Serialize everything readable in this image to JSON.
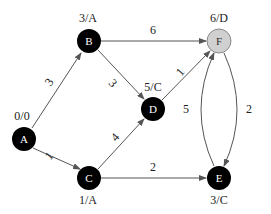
{
  "graph": {
    "nodes": [
      {
        "id": "A",
        "label": "A",
        "annotation": "0/0",
        "x": 24,
        "y": 139,
        "fill": "#000000",
        "highlighted": false
      },
      {
        "id": "B",
        "label": "B",
        "annotation": "3/A",
        "x": 89,
        "y": 41,
        "fill": "#000000",
        "highlighted": false
      },
      {
        "id": "C",
        "label": "C",
        "annotation": "1/A",
        "x": 89,
        "y": 178,
        "fill": "#000000",
        "highlighted": false
      },
      {
        "id": "D",
        "label": "D",
        "annotation": "5/C",
        "x": 153,
        "y": 109,
        "fill": "#000000",
        "highlighted": false
      },
      {
        "id": "E",
        "label": "E",
        "annotation": "3/C",
        "x": 219,
        "y": 178,
        "fill": "#000000",
        "highlighted": false
      },
      {
        "id": "F",
        "label": "F",
        "annotation": "6/D",
        "x": 219,
        "y": 41,
        "fill": "#d0d0d0",
        "highlighted": true
      }
    ],
    "edges": [
      {
        "from": "A",
        "to": "B",
        "weight": "3"
      },
      {
        "from": "A",
        "to": "C",
        "weight": "1"
      },
      {
        "from": "B",
        "to": "D",
        "weight": "3"
      },
      {
        "from": "B",
        "to": "F",
        "weight": "6"
      },
      {
        "from": "C",
        "to": "D",
        "weight": "4"
      },
      {
        "from": "D",
        "to": "F",
        "weight": "1"
      },
      {
        "from": "C",
        "to": "E",
        "weight": "2"
      },
      {
        "from": "F",
        "to": "E",
        "weight": "2"
      },
      {
        "from": "E",
        "to": "F",
        "weight": "5"
      }
    ]
  }
}
